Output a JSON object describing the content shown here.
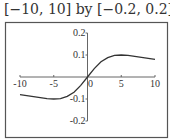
{
  "title": "[−10, 10] by [−0.2, 0.2]",
  "chart_data": {
    "type": "line",
    "title": "[−10, 10] by [−0.2, 0.2]",
    "xlabel": "",
    "ylabel": "",
    "xlim": [
      -10,
      10
    ],
    "ylim": [
      -0.2,
      0.2
    ],
    "grid": false,
    "x_ticks": [
      -10,
      -5,
      0,
      5,
      10
    ],
    "x_tick_labels": [
      "-10",
      "-5",
      "0",
      "5",
      "10"
    ],
    "y_ticks": [
      0.2,
      0.1,
      -0.1,
      -0.2
    ],
    "y_tick_labels": [
      "0.2",
      "0.1",
      "-0.1",
      "-0.2"
    ],
    "series": [
      {
        "name": "f(x)",
        "x": [
          -10,
          -8,
          -6,
          -5,
          -4,
          -3,
          -2,
          -1,
          0,
          1,
          2,
          3,
          4,
          5,
          6,
          8,
          10
        ],
        "values": [
          -0.08,
          -0.089,
          -0.098,
          -0.1,
          -0.098,
          -0.088,
          -0.069,
          -0.038,
          0,
          0.038,
          0.069,
          0.088,
          0.098,
          0.1,
          0.098,
          0.089,
          0.08
        ]
      }
    ]
  },
  "colors": {
    "frame": "#555555",
    "axis": "#666666",
    "curve": "#333333"
  }
}
